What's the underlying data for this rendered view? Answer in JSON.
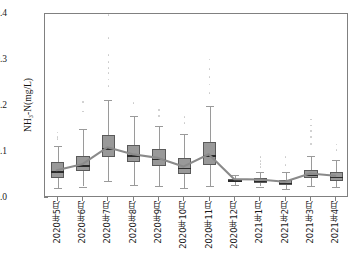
{
  "chart_data": {
    "type": "box",
    "title": "",
    "xlabel": "",
    "ylabel": "NH₃-N(mg/L)",
    "ylim": [
      0.0,
      0.4
    ],
    "ytick_labels": [
      "0.0",
      "0.1",
      "0.2",
      "0.3",
      "0.4"
    ],
    "ytick_values": [
      0.0,
      0.1,
      0.2,
      0.3,
      0.4
    ],
    "grid": false,
    "legend": "none",
    "categories": [
      "2020年5月",
      "2020年6月",
      "2020年7月",
      "2020年8月",
      "2020年9月",
      "2020年10月",
      "2020年11月",
      "2020年12月",
      "2021年1月",
      "2021年2月",
      "2021年3月",
      "2021年4月"
    ],
    "boxes": [
      {
        "category": "2020年5月",
        "min": 0.021,
        "q1": 0.044,
        "median": 0.058,
        "q3": 0.079,
        "max": 0.112,
        "outliers": [
          0.128,
          0.133,
          0.142
        ]
      },
      {
        "category": "2020年6月",
        "min": 0.025,
        "q1": 0.059,
        "median": 0.071,
        "q3": 0.091,
        "max": 0.151,
        "outliers": [
          0.188,
          0.209
        ]
      },
      {
        "category": "2020年7月",
        "min": 0.037,
        "q1": 0.09,
        "median": 0.108,
        "q3": 0.138,
        "max": 0.213,
        "outliers": [
          0.243,
          0.258,
          0.272,
          0.283,
          0.296,
          0.311,
          0.348,
          0.398
        ]
      },
      {
        "category": "2020年8月",
        "min": 0.028,
        "q1": 0.078,
        "median": 0.093,
        "q3": 0.116,
        "max": 0.178,
        "outliers": [
          0.206
        ]
      },
      {
        "category": "2020年9月",
        "min": 0.027,
        "q1": 0.07,
        "median": 0.085,
        "q3": 0.106,
        "max": 0.156,
        "outliers": [
          0.178,
          0.191
        ]
      },
      {
        "category": "2020年10月",
        "min": 0.022,
        "q1": 0.053,
        "median": 0.066,
        "q3": 0.088,
        "max": 0.139,
        "outliers": [
          0.163,
          0.176
        ]
      },
      {
        "category": "2020年11月",
        "min": 0.026,
        "q1": 0.072,
        "median": 0.093,
        "q3": 0.122,
        "max": 0.199,
        "outliers": [
          0.228,
          0.247,
          0.263,
          0.281,
          0.301
        ]
      },
      {
        "category": "2020年12月",
        "min": 0.029,
        "q1": 0.036,
        "median": 0.039,
        "q3": 0.042,
        "max": 0.049,
        "outliers": []
      },
      {
        "category": "2021年1月",
        "min": 0.025,
        "q1": 0.033,
        "median": 0.038,
        "q3": 0.044,
        "max": 0.056,
        "outliers": [
          0.067,
          0.074,
          0.081,
          0.089
        ]
      },
      {
        "category": "2021年2月",
        "min": 0.019,
        "q1": 0.028,
        "median": 0.033,
        "q3": 0.04,
        "max": 0.056,
        "outliers": [
          0.072,
          0.089
        ]
      },
      {
        "category": "2021年3月",
        "min": 0.026,
        "q1": 0.043,
        "median": 0.051,
        "q3": 0.061,
        "max": 0.091,
        "outliers": [
          0.118,
          0.133,
          0.146,
          0.158,
          0.171
        ]
      },
      {
        "category": "2021年4月",
        "min": 0.024,
        "q1": 0.038,
        "median": 0.046,
        "q3": 0.057,
        "max": 0.083,
        "outliers": [
          0.104,
          0.116
        ]
      }
    ],
    "trend_series": {
      "name": "median-trend",
      "values": [
        0.058,
        0.071,
        0.108,
        0.093,
        0.085,
        0.066,
        0.093,
        0.039,
        0.038,
        0.033,
        0.051,
        0.046
      ]
    },
    "colors": {
      "box_fill": "#999999",
      "box_edge": "#5a5a5a",
      "median": "#2b2b2b",
      "whisker": "#9a9a9a",
      "outlier": "#c9c9c9",
      "trend_line": "#8a8a8a",
      "axis": "#808080",
      "text": "#1a1a1a"
    }
  }
}
